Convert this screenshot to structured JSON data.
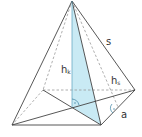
{
  "diagram": {
    "type": "square-pyramid",
    "labels": {
      "s": "s",
      "hk": "h",
      "hk_sub": "k",
      "hs": "h",
      "hs_sub": "s",
      "a": "a"
    },
    "colors": {
      "line": "#444444",
      "dashed": "#999999",
      "fill": "#bfe6f2",
      "angle": "#3a7fa0"
    }
  }
}
